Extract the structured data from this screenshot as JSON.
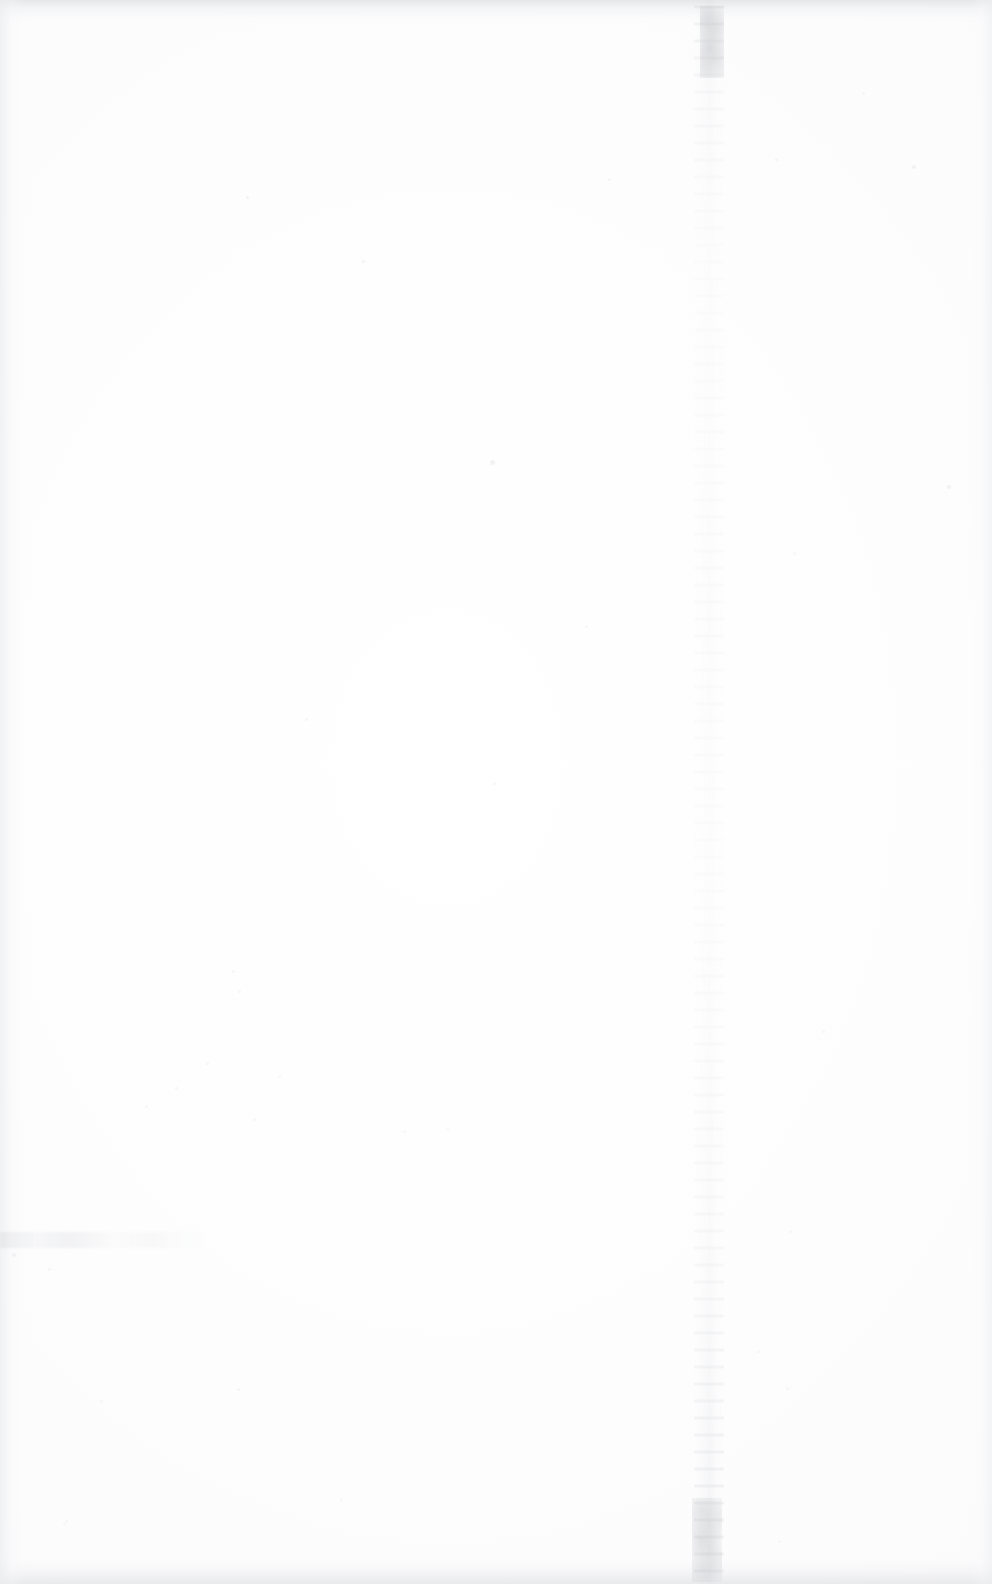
{
  "document": {
    "type": "scanned-page",
    "page_content": "",
    "description": "Blank scanned page — no printed text, headings, figures or page number visible",
    "text_blocks": [],
    "page_number_label": "",
    "orientation": "portrait",
    "page_width_px": 992,
    "page_height_px": 1584
  },
  "colors": {
    "paper": "#ffffff",
    "edge_shadow": "#e2e3e6",
    "gutter_streak": "#bcbec4",
    "speck": "#b0b2b8"
  },
  "artifacts": {
    "gutter_streak_label": "vertical scan crease streak",
    "top_edge_label": "top edge scan shadow",
    "bottom_edge_label": "bottom edge scan shadow",
    "left_edge_label": "left edge scan shadow",
    "right_edge_label": "right edge scan shadow",
    "smudge_label": "horizontal smudge streak",
    "specks": [
      {
        "x": 246,
        "y": 196,
        "size": 3,
        "opacity": 0.3
      },
      {
        "x": 362,
        "y": 260,
        "size": 3,
        "opacity": 0.26
      },
      {
        "x": 490,
        "y": 460,
        "size": 5,
        "opacity": 0.34
      },
      {
        "x": 912,
        "y": 165,
        "size": 4,
        "opacity": 0.3
      },
      {
        "x": 947,
        "y": 485,
        "size": 4,
        "opacity": 0.32
      },
      {
        "x": 493,
        "y": 782,
        "size": 3,
        "opacity": 0.24
      },
      {
        "x": 305,
        "y": 718,
        "size": 3,
        "opacity": 0.22
      },
      {
        "x": 585,
        "y": 625,
        "size": 3,
        "opacity": 0.2
      },
      {
        "x": 232,
        "y": 970,
        "size": 3,
        "opacity": 0.22
      },
      {
        "x": 238,
        "y": 990,
        "size": 3,
        "opacity": 0.2
      },
      {
        "x": 206,
        "y": 1062,
        "size": 3,
        "opacity": 0.22
      },
      {
        "x": 278,
        "y": 1075,
        "size": 3,
        "opacity": 0.2
      },
      {
        "x": 175,
        "y": 1087,
        "size": 3,
        "opacity": 0.22
      },
      {
        "x": 145,
        "y": 1105,
        "size": 3,
        "opacity": 0.2
      },
      {
        "x": 253,
        "y": 1118,
        "size": 3,
        "opacity": 0.2
      },
      {
        "x": 403,
        "y": 1130,
        "size": 3,
        "opacity": 0.2
      },
      {
        "x": 446,
        "y": 1128,
        "size": 3,
        "opacity": 0.18
      },
      {
        "x": 48,
        "y": 1268,
        "size": 3,
        "opacity": 0.22
      },
      {
        "x": 100,
        "y": 1400,
        "size": 3,
        "opacity": 0.22
      },
      {
        "x": 237,
        "y": 1388,
        "size": 3,
        "opacity": 0.24
      },
      {
        "x": 65,
        "y": 1520,
        "size": 3,
        "opacity": 0.2
      },
      {
        "x": 63,
        "y": 1523,
        "size": 3,
        "opacity": 0.18
      },
      {
        "x": 340,
        "y": 1498,
        "size": 3,
        "opacity": 0.18
      },
      {
        "x": 786,
        "y": 1387,
        "size": 3,
        "opacity": 0.2
      },
      {
        "x": 757,
        "y": 1350,
        "size": 3,
        "opacity": 0.18
      },
      {
        "x": 608,
        "y": 178,
        "size": 3,
        "opacity": 0.26
      },
      {
        "x": 775,
        "y": 158,
        "size": 3,
        "opacity": 0.22
      },
      {
        "x": 862,
        "y": 92,
        "size": 3,
        "opacity": 0.2
      },
      {
        "x": 793,
        "y": 552,
        "size": 3,
        "opacity": 0.2
      },
      {
        "x": 822,
        "y": 1030,
        "size": 3,
        "opacity": 0.2
      },
      {
        "x": 789,
        "y": 1230,
        "size": 3,
        "opacity": 0.18
      },
      {
        "x": 12,
        "y": 1253,
        "size": 4,
        "opacity": 0.3
      },
      {
        "x": 778,
        "y": 1540,
        "size": 3,
        "opacity": 0.2
      }
    ]
  }
}
